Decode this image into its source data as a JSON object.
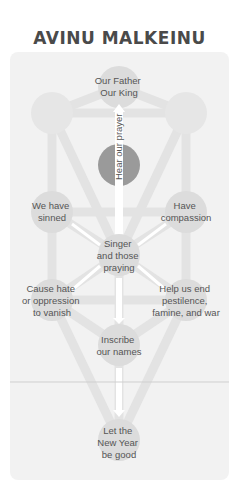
{
  "title": "AVINU MALKEINU",
  "colors": {
    "panel": "#f2f2f2",
    "path": "#e3e3e3",
    "node": "#dcdcdc",
    "center_node": "#9a9a9a",
    "text": "#555555",
    "title": "#4a4a4a",
    "arrow": "#ffffff"
  },
  "nodes": {
    "top": {
      "lines": [
        "Our Father",
        "Our King"
      ]
    },
    "upper_left": {
      "lines": []
    },
    "upper_right": {
      "lines": []
    },
    "center": {
      "lines": []
    },
    "mid_left": {
      "lines": [
        "We have",
        "sinned"
      ]
    },
    "mid_right": {
      "lines": [
        "Have",
        "compassion"
      ]
    },
    "singer": {
      "lines": [
        "Singer",
        "and those",
        "praying"
      ]
    },
    "lower_left": {
      "lines": [
        "Cause hate",
        "or oppression",
        "to vanish"
      ]
    },
    "lower_right": {
      "lines": [
        "Help us end",
        "pestilence,",
        "famine, and war"
      ]
    },
    "inscribe": {
      "lines": [
        "Inscribe",
        "our names"
      ]
    },
    "bottom": {
      "lines": [
        "Let the",
        "New Year",
        "be good"
      ]
    }
  },
  "arrow_label": "Hear our prayer"
}
